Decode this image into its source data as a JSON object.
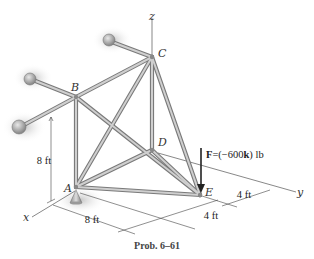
{
  "figure": {
    "caption": "Prob. 6–61",
    "axes": {
      "x": "x",
      "y": "y",
      "z": "z"
    },
    "joints": {
      "A": "A",
      "B": "B",
      "C": "C",
      "D": "D",
      "E": "E"
    },
    "dimensions": {
      "vertical_AB": "8 ft",
      "horizontal_A": "8 ft",
      "offset_1": "4 ft",
      "offset_2": "4 ft"
    },
    "force": {
      "label_prefix": "F",
      "label_eq": "=(−600",
      "label_unit_vector": "k",
      "label_suffix": ") lb",
      "applied_at": "E",
      "direction": "-z"
    },
    "colors": {
      "member": "#7a7a7a",
      "member_highlight": "#cfcfcf",
      "shadow": "#c8c8c8"
    }
  }
}
